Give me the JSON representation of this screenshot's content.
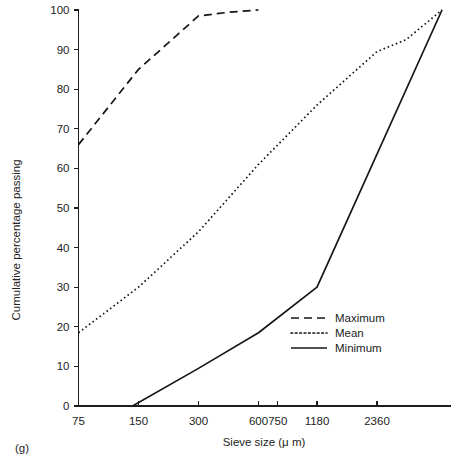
{
  "figure": {
    "panel_label": "(g)"
  },
  "chart_data": {
    "type": "line",
    "title": "",
    "xlabel": "Sieve size (μ m)",
    "ylabel": "Cumulative percentage passing",
    "xscale": "log",
    "xlim": [
      75,
      5000
    ],
    "ylim": [
      0,
      100
    ],
    "grid": false,
    "legend_position": "center-right",
    "xticks": [
      75,
      150,
      300,
      600,
      750,
      1180,
      2360
    ],
    "xtick_labels": [
      "75",
      "150",
      "300",
      "600",
      "750",
      "1180",
      "2360"
    ],
    "yticks": [
      0,
      10,
      20,
      30,
      40,
      50,
      60,
      70,
      80,
      90,
      100
    ],
    "ytick_labels": [
      "0",
      "10",
      "20",
      "30",
      "40",
      "50",
      "60",
      "70",
      "80",
      "90",
      "100"
    ],
    "series": [
      {
        "name": "Maximum",
        "style": "dashed",
        "dasharray": "8,5",
        "color": "#161616",
        "x": [
          75,
          150,
          300,
          420,
          600
        ],
        "values": [
          66,
          85,
          98.5,
          99.4,
          100
        ]
      },
      {
        "name": "Mean",
        "style": "dotted",
        "dasharray": "1.6,2.8",
        "color": "#161616",
        "x": [
          75,
          150,
          300,
          600,
          1180,
          2360,
          3300,
          5000
        ],
        "values": [
          18.5,
          30,
          44,
          61,
          76,
          89.5,
          92.5,
          100
        ]
      },
      {
        "name": "Minimum",
        "style": "solid",
        "dasharray": "none",
        "color": "#161616",
        "x": [
          140,
          300,
          600,
          1180,
          5000
        ],
        "values": [
          0,
          9.5,
          18.5,
          30,
          100
        ]
      }
    ]
  },
  "legend": {
    "entries": [
      {
        "label": "Maximum"
      },
      {
        "label": "Mean"
      },
      {
        "label": "Minimum"
      }
    ]
  }
}
